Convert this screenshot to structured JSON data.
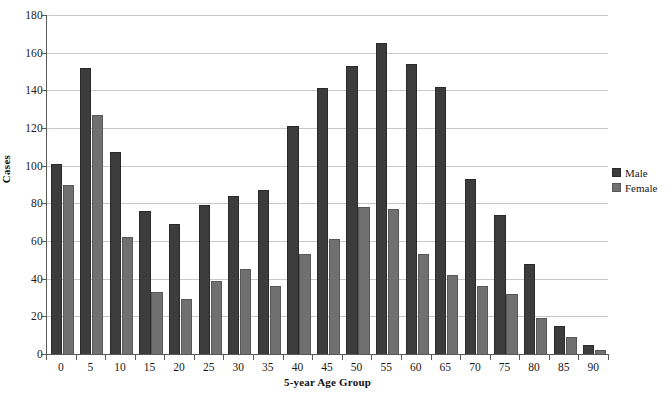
{
  "chart_data": {
    "type": "bar",
    "title": "",
    "xlabel": "5-year Age Group",
    "ylabel": "Cases",
    "categories": [
      "0",
      "5",
      "10",
      "15",
      "20",
      "25",
      "30",
      "35",
      "40",
      "45",
      "50",
      "55",
      "60",
      "65",
      "70",
      "75",
      "80",
      "85",
      "90"
    ],
    "series": [
      {
        "name": "Male",
        "color": "#3c3c3c",
        "values": [
          101,
          152,
          107,
          76,
          69,
          79,
          84,
          87,
          121,
          141,
          153,
          165,
          154,
          142,
          93,
          74,
          48,
          15,
          5
        ]
      },
      {
        "name": "Female",
        "color": "#707070",
        "values": [
          90,
          127,
          62,
          33,
          29,
          39,
          45,
          36,
          53,
          61,
          78,
          77,
          53,
          42,
          36,
          32,
          19,
          9,
          2
        ]
      }
    ],
    "ylim": [
      0,
      180
    ],
    "yticks": [
      0,
      20,
      40,
      60,
      80,
      100,
      120,
      140,
      160,
      180
    ],
    "grid": true,
    "legend_position": "right"
  },
  "legend": {
    "entries": [
      {
        "label": "Male"
      },
      {
        "label": "Female"
      }
    ]
  },
  "axes": {
    "y_title": "Cases",
    "x_title": "5-year Age Group"
  }
}
